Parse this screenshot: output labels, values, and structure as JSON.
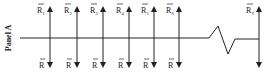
{
  "panel_label": "Panel A",
  "top_labels": [
    {
      "base": "R",
      "accent": "~",
      "sub": "1"
    },
    {
      "base": "R",
      "accent": "~",
      "sub": "2"
    },
    {
      "base": "R",
      "accent": "~",
      "sub": "3"
    },
    {
      "base": "R",
      "accent": "~",
      "sub": "4"
    },
    {
      "base": "R",
      "accent": "~",
      "sub": "5"
    },
    {
      "base": "R",
      "accent": "~",
      "sub": "6"
    },
    {
      "base": "R",
      "accent": "~",
      "sub": "T"
    }
  ],
  "bottom_labels": [
    "R",
    "R",
    "R",
    "R",
    "R",
    "R",
    ""
  ],
  "bottom_accent": "bar",
  "timeline": {
    "has_break": true
  },
  "colors": {
    "line": "#222222",
    "background": "#ffffff"
  }
}
